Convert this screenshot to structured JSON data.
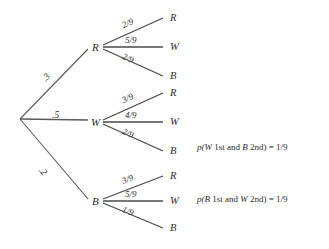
{
  "diagram": {
    "root": {
      "label": ""
    },
    "first_level": [
      {
        "node": "R",
        "prob": ".3"
      },
      {
        "node": "W",
        "prob": ".5"
      },
      {
        "node": "B",
        "prob": ".2"
      }
    ],
    "second_level": [
      {
        "parent": "R",
        "branches": [
          {
            "prob": "2/9",
            "leaf": "R"
          },
          {
            "prob": "5/9",
            "leaf": "W"
          },
          {
            "prob": "2/9",
            "leaf": "B"
          }
        ]
      },
      {
        "parent": "W",
        "branches": [
          {
            "prob": "3/9",
            "leaf": "R"
          },
          {
            "prob": "4/9",
            "leaf": "W"
          },
          {
            "prob": "2/9",
            "leaf": "B"
          }
        ]
      },
      {
        "parent": "B",
        "branches": [
          {
            "prob": "3/9",
            "leaf": "R"
          },
          {
            "prob": "5/9",
            "leaf": "W"
          },
          {
            "prob": "1/9",
            "leaf": "B"
          }
        ]
      }
    ],
    "annotations": [
      {
        "id": "note-w-b",
        "prefix": "p(",
        "first": "W",
        "mid": " 1st and ",
        "second": "B",
        "suffix": " 2nd) = 1/9"
      },
      {
        "id": "note-b-w",
        "prefix": "p(",
        "first": "B",
        "mid": " 1st and ",
        "second": "W",
        "suffix": " 2nd) = 1/9"
      }
    ],
    "colors": {
      "line": "#4a4a4a",
      "text": "#2b2b2b",
      "background": "#ffffff"
    }
  }
}
